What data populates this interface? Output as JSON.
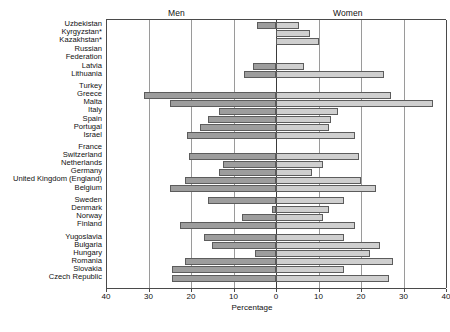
{
  "headers": {
    "men": "Men",
    "women": "Women"
  },
  "axis": {
    "xlabel": "Percentage",
    "ticks": [
      {
        "value": -40,
        "label": "40"
      },
      {
        "value": -30,
        "label": "30"
      },
      {
        "value": -20,
        "label": "20"
      },
      {
        "value": -10,
        "label": "10"
      },
      {
        "value": 0,
        "label": "0"
      },
      {
        "value": 10,
        "label": "10"
      },
      {
        "value": 20,
        "label": "20"
      },
      {
        "value": 30,
        "label": "30"
      },
      {
        "value": 40,
        "label": "40"
      }
    ]
  },
  "chart_data": {
    "type": "bar",
    "title": "",
    "subtitle": "",
    "xlabel": "Percentage",
    "ylabel": "",
    "xlim": [
      -40,
      40
    ],
    "grid": true,
    "legend_position": "top",
    "orientation": "horizontal",
    "layout": "population-pyramid",
    "series": [
      {
        "name": "Men",
        "color": "#9d9d9d",
        "direction": "left"
      },
      {
        "name": "Women",
        "color": "#cfcfcf",
        "direction": "right"
      }
    ],
    "categories": [
      "Uzbekistan",
      "Kyrgyzstan*",
      "Kazakhstan*",
      "Russian Federation",
      "Latvia",
      "Lithuania",
      "Turkey",
      "Greece",
      "Malta",
      "Italy",
      "Spain",
      "Portugal",
      "Israel",
      "France",
      "Switzerland",
      "Netherlands",
      "Germany",
      "United Kingdom (England)",
      "Belgium",
      "Sweden",
      "Denmark",
      "Norway",
      "Finland",
      "Yugoslavia",
      "Bulgaria",
      "Hungary",
      "Romania",
      "Slovakia",
      "Czech Republic"
    ],
    "rows": [
      {
        "category": "Uzbekistan",
        "men": 4.5,
        "women": 5.5,
        "group": 0
      },
      {
        "category": "Kyrgyzstan*",
        "men": 0.0,
        "women": 8.0,
        "group": 0
      },
      {
        "category": "Kazakhstan*",
        "men": 0.0,
        "women": 10.0,
        "group": 0
      },
      {
        "category": "Russian Federation",
        "men": 0.0,
        "women": 0.0,
        "group": 1
      },
      {
        "category": "Latvia",
        "men": 5.5,
        "women": 6.5,
        "group": 2
      },
      {
        "category": "Lithuania",
        "men": 7.5,
        "women": 25.5,
        "group": 2
      },
      {
        "category": "Turkey",
        "men": 0.0,
        "women": 0.0,
        "group": 3
      },
      {
        "category": "Greece",
        "men": 31.0,
        "women": 27.0,
        "group": 3
      },
      {
        "category": "Malta",
        "men": 25.0,
        "women": 37.0,
        "group": 3
      },
      {
        "category": "Italy",
        "men": 13.5,
        "women": 14.5,
        "group": 3
      },
      {
        "category": "Spain",
        "men": 16.0,
        "women": 13.0,
        "group": 3
      },
      {
        "category": "Portugal",
        "men": 18.0,
        "women": 12.5,
        "group": 3
      },
      {
        "category": "Israel",
        "men": 21.0,
        "women": 18.5,
        "group": 3
      },
      {
        "category": "France",
        "men": 0.0,
        "women": 0.0,
        "group": 4
      },
      {
        "category": "Switzerland",
        "men": 20.5,
        "women": 19.5,
        "group": 4
      },
      {
        "category": "Netherlands",
        "men": 12.5,
        "women": 11.0,
        "group": 4
      },
      {
        "category": "Germany",
        "men": 13.5,
        "women": 8.5,
        "group": 4
      },
      {
        "category": "United Kingdom (England)",
        "men": 21.5,
        "women": 20.0,
        "group": 4
      },
      {
        "category": "Belgium",
        "men": 25.0,
        "women": 23.5,
        "group": 4
      },
      {
        "category": "Sweden",
        "men": 16.0,
        "women": 16.0,
        "group": 5
      },
      {
        "category": "Denmark",
        "men": 1.0,
        "women": 12.5,
        "group": 5
      },
      {
        "category": "Norway",
        "men": 8.0,
        "women": 11.0,
        "group": 5
      },
      {
        "category": "Finland",
        "men": 22.5,
        "women": 18.5,
        "group": 5
      },
      {
        "category": "Yugoslavia",
        "men": 17.0,
        "women": 16.0,
        "group": 6
      },
      {
        "category": "Bulgaria",
        "men": 15.0,
        "women": 24.5,
        "group": 6
      },
      {
        "category": "Hungary",
        "men": 5.0,
        "women": 22.0,
        "group": 6
      },
      {
        "category": "Romania",
        "men": 21.5,
        "women": 27.5,
        "group": 6
      },
      {
        "category": "Slovakia",
        "men": 24.5,
        "women": 16.0,
        "group": 6
      },
      {
        "category": "Czech Republic",
        "men": 24.5,
        "women": 26.5,
        "group": 6
      }
    ]
  },
  "colors": {
    "men_bar": "#9d9d9d",
    "women_bar": "#cfcfcf",
    "bar_border": "#5c5c5c",
    "gridline": "#9a9a9a",
    "axis": "#4a4a4a",
    "text": "#111111",
    "background": "#ffffff"
  }
}
